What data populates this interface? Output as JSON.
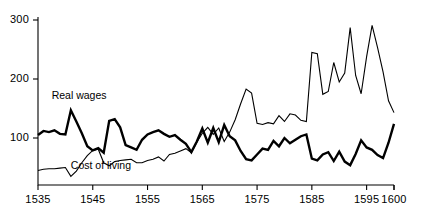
{
  "chart_data": {
    "type": "line",
    "title": "",
    "subtitle": "",
    "xlabel": "",
    "ylabel": "",
    "xlim": [
      1535,
      1600
    ],
    "ylim": [
      20,
      305
    ],
    "grid": false,
    "legend_position": "inline-annotations",
    "xticks": [
      1535,
      1545,
      1555,
      1565,
      1575,
      1585,
      1595,
      1600
    ],
    "xticklabels": [
      "1535",
      "1545",
      "1555",
      "1565",
      "1575",
      "1585",
      "1595",
      "1600"
    ],
    "yticks": [
      100,
      200,
      300
    ],
    "yticklabels": [
      "100",
      "200",
      "300"
    ],
    "annotations": [
      {
        "text": "Real wages",
        "x": 1537.5,
        "y": 172
      },
      {
        "text": "Cost of living",
        "x": 1541,
        "y": 52
      }
    ],
    "x": [
      1535,
      1536,
      1537,
      1538,
      1539,
      1540,
      1541,
      1542,
      1543,
      1544,
      1545,
      1546,
      1547,
      1548,
      1549,
      1550,
      1551,
      1552,
      1553,
      1554,
      1555,
      1556,
      1557,
      1558,
      1559,
      1560,
      1561,
      1562,
      1563,
      1564,
      1565,
      1566,
      1567,
      1568,
      1569,
      1570,
      1571,
      1572,
      1573,
      1574,
      1575,
      1576,
      1577,
      1578,
      1579,
      1580,
      1581,
      1582,
      1583,
      1584,
      1585,
      1586,
      1587,
      1588,
      1589,
      1590,
      1591,
      1592,
      1593,
      1594,
      1595,
      1596,
      1597,
      1598,
      1599,
      1600
    ],
    "series": [
      {
        "name": "Real wages",
        "style": "thick",
        "values": [
          105,
          112,
          110,
          113,
          107,
          106,
          147,
          128,
          108,
          86,
          79,
          83,
          75,
          129,
          132,
          118,
          88,
          84,
          80,
          97,
          106,
          110,
          113,
          107,
          102,
          105,
          97,
          90,
          76,
          94,
          116,
          92,
          117,
          93,
          122,
          103,
          96,
          78,
          64,
          62,
          72,
          82,
          80,
          95,
          86,
          100,
          91,
          97,
          103,
          106,
          65,
          62,
          72,
          76,
          61,
          77,
          60,
          54,
          73,
          96,
          84,
          80,
          71,
          66,
          92,
          124
        ]
      },
      {
        "name": "Cost of living",
        "style": "thin",
        "values": [
          45,
          47,
          48,
          48,
          49,
          50,
          35,
          44,
          58,
          70,
          79,
          81,
          58,
          53,
          60,
          62,
          63,
          64,
          58,
          58,
          62,
          64,
          68,
          61,
          72,
          74,
          78,
          82,
          75,
          93,
          108,
          118,
          106,
          117,
          94,
          110,
          131,
          158,
          183,
          176,
          125,
          123,
          126,
          124,
          138,
          128,
          141,
          139,
          130,
          128,
          245,
          243,
          174,
          179,
          228,
          195,
          210,
          287,
          206,
          175,
          238,
          291,
          253,
          212,
          163,
          143
        ]
      }
    ]
  }
}
